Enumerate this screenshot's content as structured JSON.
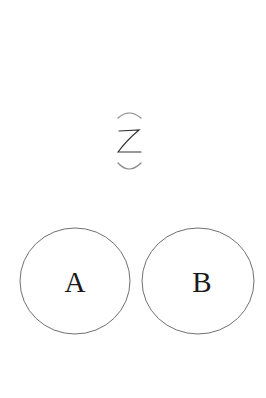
{
  "diagram": {
    "background": "#ffffff",
    "stroke_color": "#707070",
    "symbol": {
      "name": "rotated-parenthesized-z",
      "glyph": "Z",
      "has_top_arc": true,
      "has_bottom_arc": true
    },
    "circles": [
      {
        "id": "A",
        "label": "A",
        "cx": 75,
        "cy": 281,
        "rx": 55,
        "ry": 53
      },
      {
        "id": "B",
        "label": "B",
        "cx": 198,
        "cy": 281,
        "rx": 56,
        "ry": 53
      }
    ]
  }
}
